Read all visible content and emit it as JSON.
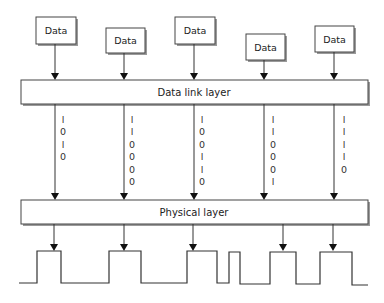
{
  "data_boxes": [
    {
      "label": "Data",
      "x": 36,
      "y": 17,
      "w": 40,
      "h": 27,
      "arrow_x": 55
    },
    {
      "label": "Data",
      "x": 106,
      "y": 28,
      "w": 39,
      "h": 25,
      "arrow_x": 124
    },
    {
      "label": "Data",
      "x": 175,
      "y": 17,
      "w": 40,
      "h": 27,
      "arrow_x": 194
    },
    {
      "label": "Data",
      "x": 246,
      "y": 34,
      "w": 39,
      "h": 26,
      "arrow_x": 264
    },
    {
      "label": "Data",
      "x": 315,
      "y": 26,
      "w": 39,
      "h": 26,
      "arrow_x": 334
    }
  ],
  "data_link_layer": {
    "label": "Data link layer",
    "x": 21,
    "y": 80,
    "w": 347,
    "h": 24
  },
  "physical_layer": {
    "label": "Physical layer",
    "x": 21,
    "y": 200,
    "w": 347,
    "h": 24
  },
  "bit_columns": [
    {
      "x": 55,
      "text_x": 63,
      "bits": [
        "1",
        "0",
        "1",
        "0"
      ]
    },
    {
      "x": 124,
      "text_x": 132,
      "bits": [
        "1",
        "1",
        "0",
        "0",
        "0",
        "0"
      ]
    },
    {
      "x": 194,
      "text_x": 202,
      "bits": [
        "1",
        "0",
        "0",
        "1",
        "1",
        "0"
      ]
    },
    {
      "x": 264,
      "text_x": 273,
      "bits": [
        "1",
        "1",
        "0",
        "0",
        "0",
        "1"
      ]
    },
    {
      "x": 334,
      "text_x": 344,
      "bits": [
        "1",
        "1",
        "1",
        "1",
        "0"
      ]
    }
  ],
  "physical_arrows_x": [
    54,
    124,
    193,
    283,
    333
  ],
  "waveform": {
    "low_y": 283,
    "high_y": 251,
    "points": [
      [
        19,
        283
      ],
      [
        37,
        283
      ],
      [
        37,
        251
      ],
      [
        61,
        251
      ],
      [
        61,
        283
      ],
      [
        109,
        283
      ],
      [
        109,
        251
      ],
      [
        141,
        251
      ],
      [
        141,
        283
      ],
      [
        187,
        283
      ],
      [
        187,
        251
      ],
      [
        217,
        251
      ],
      [
        217,
        283
      ],
      [
        229,
        283
      ],
      [
        229,
        252
      ],
      [
        240,
        252
      ],
      [
        240,
        284
      ],
      [
        270,
        284
      ],
      [
        270,
        252
      ],
      [
        296,
        252
      ],
      [
        296,
        284
      ],
      [
        320,
        284
      ],
      [
        320,
        252
      ],
      [
        352,
        252
      ],
      [
        352,
        285
      ],
      [
        368,
        285
      ]
    ]
  }
}
